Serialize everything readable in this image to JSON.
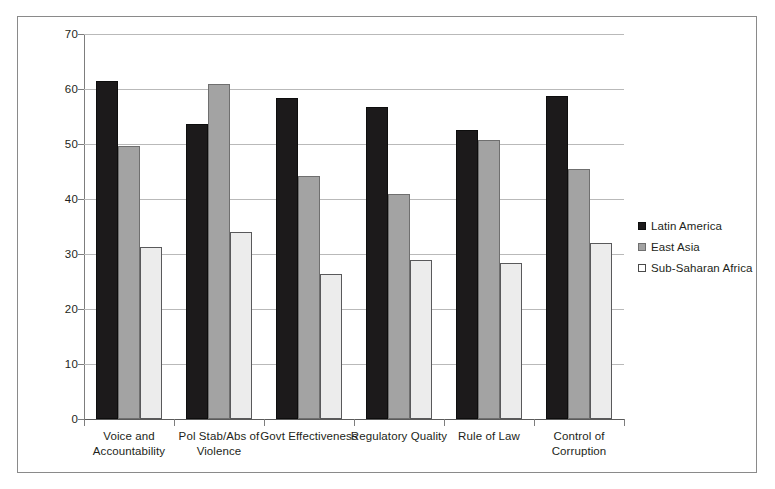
{
  "chart_data": {
    "type": "bar",
    "title": "",
    "xlabel": "",
    "ylabel": "",
    "ylim": [
      0,
      70
    ],
    "ytick_step": 10,
    "yticks": [
      0,
      10,
      20,
      30,
      40,
      50,
      60,
      70
    ],
    "grid": true,
    "legend_position": "right",
    "categories": [
      "Voice and Accountability",
      "Pol Stab/Abs of Violence",
      "Govt Effectiveness",
      "Regulatory Quality",
      "Rule of Law",
      "Control of Corruption"
    ],
    "category_lines": [
      [
        "Voice and",
        "Accountability"
      ],
      [
        "Pol Stab/Abs of",
        "Violence"
      ],
      [
        "Govt Effectiveness"
      ],
      [
        "Regulatory Quality"
      ],
      [
        "Rule of Law"
      ],
      [
        "Control of",
        "Corruption"
      ]
    ],
    "series": [
      {
        "name": "Latin America",
        "color": "#1c1a1b",
        "values": [
          61.4,
          53.7,
          58.3,
          56.7,
          52.5,
          58.8
        ]
      },
      {
        "name": "East Asia",
        "color": "#a3a3a3",
        "values": [
          49.6,
          60.9,
          44.2,
          41.0,
          50.7,
          45.5
        ]
      },
      {
        "name": "Sub-Saharan Africa",
        "color": "#ececec",
        "values": [
          31.3,
          34.0,
          26.4,
          28.9,
          28.3,
          32.0
        ]
      }
    ]
  },
  "legend": {
    "items": [
      {
        "label": "Latin America"
      },
      {
        "label": "East Asia"
      },
      {
        "label": "Sub-Saharan Africa"
      }
    ]
  },
  "axis": {
    "y_labels": [
      "70",
      "60",
      "50",
      "40",
      "30",
      "20",
      "10",
      "0"
    ]
  }
}
